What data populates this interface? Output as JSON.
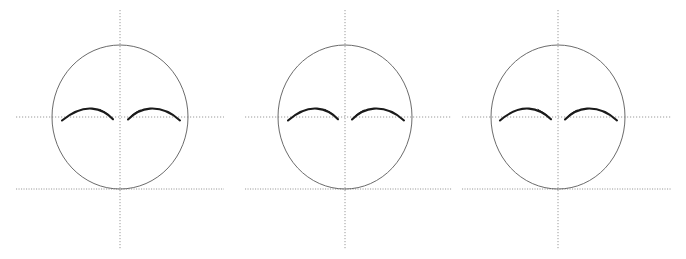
{
  "figure": {
    "background_color": "#ffffff",
    "width": 686,
    "height": 259,
    "stroke_color_circle": "#5a5a5a",
    "stroke_color_axis": "#9a9a9a",
    "stroke_color_ground": "#8c8c8c",
    "stroke_color_arc": "#1a1a1a",
    "panel_count": "3"
  },
  "panels": [
    {
      "id": "panel-1",
      "label": "",
      "center_x": "120",
      "center_y": "117",
      "radius_x": "68",
      "radius_y": "72",
      "ground_y": "189",
      "axis_h_y": "117",
      "axis_v_x": "120",
      "axis_h_x1": "16",
      "axis_h_x2": "224",
      "axis_v_y1": "10",
      "axis_v_y2": "249",
      "ground_x1": "16",
      "ground_x2": "224",
      "left_arc": {
        "x_start": "62",
        "x_end": "113",
        "peak_x": "90",
        "peak_y": "109",
        "y_start": "120",
        "y_end": "119"
      },
      "right_arc": {
        "x_start": "128",
        "x_end": "180",
        "peak_x": "152",
        "peak_y": "109",
        "y_start": "119",
        "y_end": "120"
      }
    },
    {
      "id": "panel-2",
      "label": "",
      "center_x": "345",
      "center_y": "117",
      "radius_x": "67",
      "radius_y": "72",
      "ground_y": "189",
      "axis_h_y": "117",
      "axis_v_x": "345",
      "axis_h_x1": "245",
      "axis_h_x2": "452",
      "axis_v_y1": "10",
      "axis_v_y2": "249",
      "ground_x1": "245",
      "ground_x2": "452",
      "left_arc": {
        "x_start": "288",
        "x_end": "338",
        "peak_x": "314",
        "peak_y": "109",
        "y_start": "120",
        "y_end": "119"
      },
      "right_arc": {
        "x_start": "352",
        "x_end": "404",
        "peak_x": "377",
        "peak_y": "109",
        "y_start": "119",
        "y_end": "120"
      }
    },
    {
      "id": "panel-3",
      "label": "",
      "center_x": "558",
      "center_y": "117",
      "radius_x": "67",
      "radius_y": "72",
      "ground_y": "189",
      "axis_h_y": "117",
      "axis_v_x": "558",
      "axis_h_x1": "462",
      "axis_h_x2": "672",
      "axis_v_y1": "10",
      "axis_v_y2": "249",
      "ground_x1": "462",
      "ground_x2": "672",
      "left_arc": {
        "x_start": "500",
        "x_end": "551",
        "peak_x": "526",
        "peak_y": "109",
        "y_start": "120",
        "y_end": "119"
      },
      "right_arc": {
        "x_start": "565",
        "x_end": "617",
        "peak_x": "590",
        "peak_y": "109",
        "y_start": "119",
        "y_end": "120"
      }
    }
  ],
  "caption": {
    "visible": "false",
    "color": "#fcfdfd",
    "cells": [
      "",
      "",
      "",
      "",
      "",
      "",
      "",
      ""
    ]
  }
}
